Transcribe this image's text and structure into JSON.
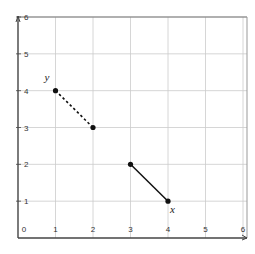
{
  "chart_data": {
    "type": "line",
    "title": "",
    "xlabel": "",
    "ylabel": "",
    "xlim": [
      0,
      6
    ],
    "ylim": [
      0,
      6
    ],
    "grid": true,
    "x_ticks": [
      "0",
      "1",
      "2",
      "3",
      "4",
      "5",
      "6"
    ],
    "y_ticks": [
      "1",
      "2",
      "3",
      "4",
      "5",
      "6"
    ],
    "series": [
      {
        "name": "y",
        "style": "dashed",
        "points": [
          [
            1,
            4
          ],
          [
            2,
            3
          ]
        ],
        "label": "y",
        "label_at": [
          1,
          4
        ]
      },
      {
        "name": "x",
        "style": "solid",
        "points": [
          [
            3,
            2
          ],
          [
            4,
            1
          ]
        ],
        "label": "x",
        "label_at": [
          4,
          1
        ]
      }
    ],
    "colors": {
      "axis": "#444444",
      "grid": "#cccccc",
      "series": "#111111"
    }
  }
}
